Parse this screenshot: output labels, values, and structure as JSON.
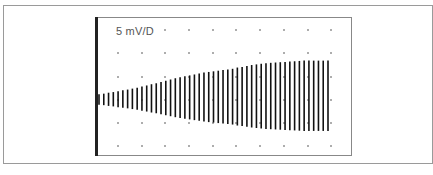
{
  "scope": {
    "scale_label": "5 mV/D",
    "grid": {
      "columns": 10,
      "rows": 6
    },
    "trace": {
      "description": "Oscillating signal with amplitude increasing over time, then saturating",
      "cycles": 49,
      "amplitude_divisions": [
        0.15,
        0.17,
        0.2,
        0.22,
        0.25,
        0.28,
        0.3,
        0.33,
        0.36,
        0.4,
        0.43,
        0.47,
        0.5,
        0.54,
        0.58,
        0.62,
        0.66,
        0.69,
        0.72,
        0.75,
        0.78,
        0.81,
        0.84,
        0.86,
        0.88,
        0.9,
        0.92,
        0.94,
        0.96,
        1.0,
        1.02,
        1.05,
        1.08,
        1.1,
        1.12,
        1.14,
        1.15,
        1.16,
        1.17,
        1.18,
        1.19,
        1.2,
        1.21,
        1.22,
        1.22,
        1.22,
        1.22,
        1.22,
        1.22
      ]
    }
  }
}
